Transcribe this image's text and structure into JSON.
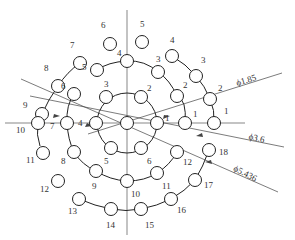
{
  "diagram": {
    "center": [
      127,
      123
    ],
    "stroke_color": "#222222",
    "axis_color": "#555555",
    "hole_radius": 6.5,
    "rings": [
      {
        "name": "inner",
        "radius_px": 30,
        "arc_deg": 360,
        "holes": [
          {
            "label": "1",
            "x": 157,
            "y": 123,
            "lx": 165,
            "ly": 121
          },
          {
            "label": "2",
            "x": 141,
            "y": 97,
            "lx": 147,
            "ly": 91
          },
          {
            "label": "3",
            "x": 106,
            "y": 97,
            "lx": 104,
            "ly": 87
          },
          {
            "label": "4",
            "x": 96,
            "y": 123,
            "lx": 78,
            "ly": 126
          },
          {
            "label": "5",
            "x": 111,
            "y": 148,
            "lx": 104,
            "ly": 164
          },
          {
            "label": "6",
            "x": 141,
            "y": 148,
            "lx": 147,
            "ly": 164
          }
        ]
      },
      {
        "name": "middle",
        "holes": [
          {
            "label": "1",
            "x": 185,
            "y": 123,
            "lx": 193,
            "ly": 117
          },
          {
            "label": "2",
            "x": 177,
            "y": 96,
            "lx": 183,
            "ly": 88
          },
          {
            "label": "3",
            "x": 158,
            "y": 72,
            "lx": 156,
            "ly": 62
          },
          {
            "label": "4",
            "x": 127,
            "y": 61,
            "lx": 117,
            "ly": 56
          },
          {
            "label": "5",
            "x": 97,
            "y": 70,
            "lx": 82,
            "ly": 70
          },
          {
            "label": "6",
            "x": 74,
            "y": 94,
            "lx": 61,
            "ly": 89
          },
          {
            "label": "7",
            "x": 67,
            "y": 123,
            "lx": 50,
            "ly": 129
          },
          {
            "label": "8",
            "x": 74,
            "y": 152,
            "lx": 61,
            "ly": 164
          },
          {
            "label": "9",
            "x": 96,
            "y": 171,
            "lx": 92,
            "ly": 189
          },
          {
            "label": "10",
            "x": 127,
            "y": 181,
            "lx": 131,
            "ly": 197
          },
          {
            "label": "11",
            "x": 157,
            "y": 173,
            "lx": 162,
            "ly": 189
          },
          {
            "label": "12",
            "x": 177,
            "y": 152,
            "lx": 183,
            "ly": 165
          }
        ]
      },
      {
        "name": "outer",
        "holes": [
          {
            "label": "1",
            "x": 214,
            "y": 123,
            "lx": 224,
            "ly": 114
          },
          {
            "label": "2",
            "x": 210,
            "y": 99,
            "lx": 218,
            "ly": 91
          },
          {
            "label": "3",
            "x": 196,
            "y": 76,
            "lx": 201,
            "ly": 63
          },
          {
            "label": "4",
            "x": 172,
            "y": 56,
            "lx": 170,
            "ly": 43
          },
          {
            "label": "5",
            "x": 142,
            "y": 42,
            "lx": 140,
            "ly": 27
          },
          {
            "label": "6",
            "x": 110,
            "y": 44,
            "lx": 101,
            "ly": 28
          },
          {
            "label": "7",
            "x": 80,
            "y": 63,
            "lx": 70,
            "ly": 48
          },
          {
            "label": "8",
            "x": 58,
            "y": 86,
            "lx": 44,
            "ly": 71
          },
          {
            "label": "9",
            "x": 42,
            "y": 114,
            "lx": 23,
            "ly": 108
          },
          {
            "label": "10",
            "x": 38,
            "y": 123,
            "lx": 16,
            "ly": 133
          },
          {
            "label": "11",
            "x": 43,
            "y": 153,
            "lx": 26,
            "ly": 163
          },
          {
            "label": "12",
            "x": 58,
            "y": 181,
            "lx": 40,
            "ly": 192
          },
          {
            "label": "13",
            "x": 79,
            "y": 199,
            "lx": 68,
            "ly": 214
          },
          {
            "label": "14",
            "x": 111,
            "y": 209,
            "lx": 106,
            "ly": 228
          },
          {
            "label": "15",
            "x": 141,
            "y": 209,
            "lx": 145,
            "ly": 228
          },
          {
            "label": "16",
            "x": 171,
            "y": 199,
            "lx": 177,
            "ly": 213
          },
          {
            "label": "17",
            "x": 195,
            "y": 180,
            "lx": 204,
            "ly": 188
          },
          {
            "label": "18",
            "x": 209,
            "y": 150,
            "lx": 219,
            "ly": 155
          }
        ]
      }
    ],
    "dimensions": [
      {
        "label": "ϕ1.85",
        "text_x": 247,
        "text_y": 83,
        "angle": -17
      },
      {
        "label": "ϕ3.6",
        "text_x": 256,
        "text_y": 141,
        "angle": 12
      },
      {
        "label": "ϕ5.436",
        "text_x": 244,
        "text_y": 176,
        "angle": 27
      }
    ]
  }
}
